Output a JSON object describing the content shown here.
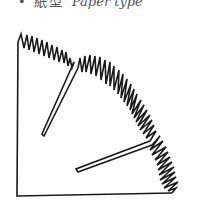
{
  "caption": {
    "bullet": "•",
    "label_zh": "紙型",
    "label_en": "Paper type"
  },
  "figure": {
    "stroke_color": "#1a1a1a",
    "fill_color": "#ffffff"
  }
}
